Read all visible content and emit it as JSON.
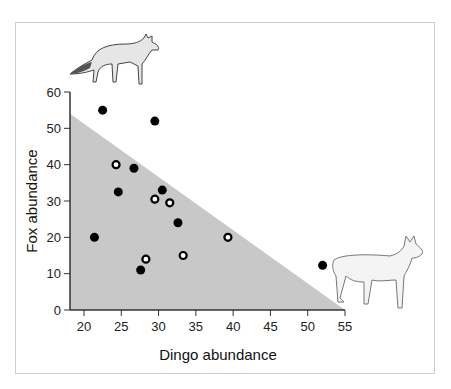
{
  "chart_data": {
    "type": "scatter",
    "title": "",
    "xlabel": "Dingo abundance",
    "ylabel": "Fox abundance",
    "xlim": [
      18,
      55
    ],
    "ylim": [
      0,
      60
    ],
    "xticks": [
      20,
      25,
      30,
      35,
      40,
      45,
      50,
      55
    ],
    "yticks": [
      0,
      10,
      20,
      30,
      40,
      50,
      60
    ],
    "grid": false,
    "legend": null,
    "shaded_region": {
      "type": "triangle",
      "vertices": [
        [
          18,
          54
        ],
        [
          18,
          0
        ],
        [
          55,
          0
        ]
      ],
      "color": "#c8c8c8"
    },
    "series": [
      {
        "name": "filled",
        "marker": "filled-circle",
        "color": "#000000",
        "points": [
          [
            22.5,
            55
          ],
          [
            29.5,
            52
          ],
          [
            26.7,
            39
          ],
          [
            24.6,
            32.5
          ],
          [
            30.5,
            33
          ],
          [
            32.6,
            24
          ],
          [
            21.4,
            20
          ],
          [
            27.6,
            11
          ],
          [
            52.0,
            12.3
          ]
        ]
      },
      {
        "name": "open",
        "marker": "open-circle",
        "color": "#000000",
        "points": [
          [
            24.3,
            40
          ],
          [
            29.5,
            30.5
          ],
          [
            31.5,
            29.5
          ],
          [
            39.3,
            20
          ],
          [
            28.3,
            14
          ],
          [
            33.3,
            15
          ]
        ]
      }
    ],
    "annotations": [
      {
        "type": "illustration",
        "label": "fox",
        "position": "top-left"
      },
      {
        "type": "illustration",
        "label": "dingo",
        "position": "bottom-right"
      }
    ]
  }
}
